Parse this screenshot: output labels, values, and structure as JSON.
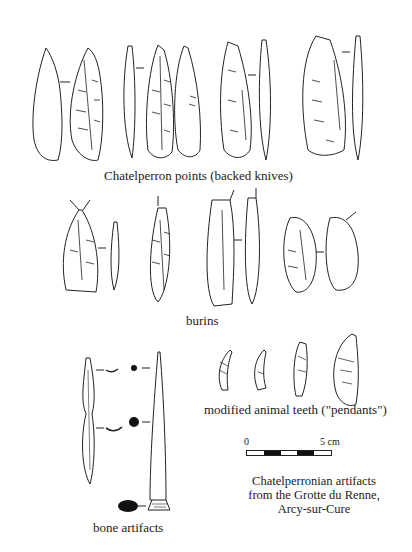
{
  "figure": {
    "sections": {
      "points": {
        "label": "Chatelperron points (backed knives)"
      },
      "burins": {
        "label": "burins"
      },
      "teeth": {
        "label": "modified animal teeth (\"pendants\")"
      },
      "bone": {
        "label": "bone artifacts"
      }
    },
    "scale_bar": {
      "start_label": "0",
      "end_label": "5 cm",
      "segments": 5
    },
    "caption": {
      "line1": "Chatelperronian artifacts",
      "line2": "from the Grotte du Renne,",
      "line3": "Arcy-sur-Cure"
    }
  }
}
